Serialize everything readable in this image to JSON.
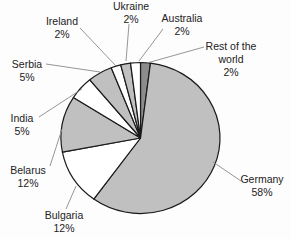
{
  "chart_data": {
    "type": "pie",
    "title": "",
    "start_angle_deg": 0,
    "direction": "clockwise",
    "outline_color": "#1A1A1A",
    "leader_line_color": "#8A8A8A",
    "categories": [
      "Rest of the world",
      "Germany",
      "Bulgaria",
      "Belarus",
      "India",
      "Serbia",
      "Ireland",
      "Ukraine",
      "Australia"
    ],
    "values": [
      2,
      58,
      12,
      12,
      5,
      5,
      2,
      2,
      2
    ],
    "slices": [
      {
        "id": "rest-of-the-world",
        "label": "Rest of the world",
        "value": 2,
        "color": "#8C8C8C",
        "label_lines": [
          "Rest of the",
          "world",
          "2%"
        ]
      },
      {
        "id": "germany",
        "label": "Germany",
        "value": 58,
        "color": "#C0C0C0",
        "label_lines": [
          "Germany",
          "58%"
        ]
      },
      {
        "id": "bulgaria",
        "label": "Bulgaria",
        "value": 12,
        "color": "#FFFFFF",
        "label_lines": [
          "Bulgaria",
          "12%"
        ]
      },
      {
        "id": "belarus",
        "label": "Belarus",
        "value": 12,
        "color": "#C0C0C0",
        "label_lines": [
          "Belarus",
          "12%"
        ]
      },
      {
        "id": "india",
        "label": "India",
        "value": 5,
        "color": "#FFFFFF",
        "label_lines": [
          "India",
          "5%"
        ]
      },
      {
        "id": "serbia",
        "label": "Serbia",
        "value": 5,
        "color": "#C0C0C0",
        "label_lines": [
          "Serbia",
          "5%"
        ]
      },
      {
        "id": "ireland",
        "label": "Ireland",
        "value": 2,
        "color": "#FFFFFF",
        "label_lines": [
          "Ireland",
          "2%"
        ]
      },
      {
        "id": "ukraine",
        "label": "Ukraine",
        "value": 2,
        "color": "#C0C0C0",
        "label_lines": [
          "Ukraine",
          "2%"
        ]
      },
      {
        "id": "australia",
        "label": "Australia",
        "value": 2,
        "color": "#FFFFFF",
        "label_lines": [
          "Australia",
          "2%"
        ]
      }
    ]
  }
}
